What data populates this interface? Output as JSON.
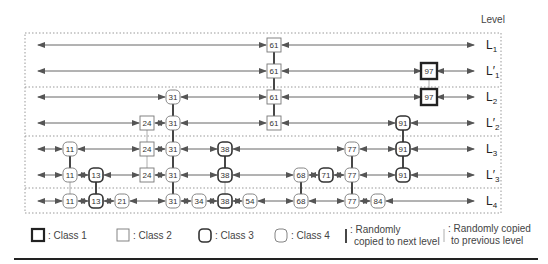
{
  "header": {
    "level_label": "Level"
  },
  "colors": {
    "line": "#555555",
    "node_stroke": "#666666",
    "class1_stroke": "#333333",
    "separator": "#999999",
    "rule": "#222222"
  },
  "levels": [
    {
      "id": "L1",
      "base": "L",
      "prime": "",
      "sub": "1",
      "y": 45
    },
    {
      "id": "L1p",
      "base": "L",
      "prime": "′",
      "sub": "1",
      "y": 71
    },
    {
      "id": "L2",
      "base": "L",
      "prime": "",
      "sub": "2",
      "y": 97
    },
    {
      "id": "L2p",
      "base": "L",
      "prime": "′",
      "sub": "2",
      "y": 123
    },
    {
      "id": "L3",
      "base": "L",
      "prime": "",
      "sub": "3",
      "y": 149
    },
    {
      "id": "L3p",
      "base": "L",
      "prime": "′",
      "sub": "3",
      "y": 175
    },
    {
      "id": "L4",
      "base": "L",
      "prime": "",
      "sub": "4",
      "y": 201
    }
  ],
  "columns": {
    "11": 70,
    "13": 96,
    "21": 122,
    "24": 147,
    "31": 173,
    "34": 199,
    "38": 225,
    "54": 250,
    "61": 274,
    "68": 301,
    "71": 326,
    "77": 352,
    "84": 378,
    "91": 403,
    "97": 429
  },
  "rows": [
    {
      "level": "L1",
      "nodes": [
        {
          "key": "61",
          "cls": 2
        }
      ]
    },
    {
      "level": "L1p",
      "nodes": [
        {
          "key": "61",
          "cls": 2
        },
        {
          "key": "97",
          "cls": 1
        }
      ]
    },
    {
      "level": "L2",
      "nodes": [
        {
          "key": "31",
          "cls": 4
        },
        {
          "key": "61",
          "cls": 2
        },
        {
          "key": "97",
          "cls": 1
        }
      ]
    },
    {
      "level": "L2p",
      "nodes": [
        {
          "key": "24",
          "cls": 2
        },
        {
          "key": "31",
          "cls": 4
        },
        {
          "key": "61",
          "cls": 2
        },
        {
          "key": "91",
          "cls": 3
        }
      ]
    },
    {
      "level": "L3",
      "nodes": [
        {
          "key": "11",
          "cls": 4
        },
        {
          "key": "24",
          "cls": 2
        },
        {
          "key": "31",
          "cls": 4
        },
        {
          "key": "38",
          "cls": 3
        },
        {
          "key": "77",
          "cls": 4
        },
        {
          "key": "91",
          "cls": 3
        }
      ]
    },
    {
      "level": "L3p",
      "nodes": [
        {
          "key": "11",
          "cls": 4
        },
        {
          "key": "13",
          "cls": 3
        },
        {
          "key": "24",
          "cls": 2
        },
        {
          "key": "31",
          "cls": 4
        },
        {
          "key": "38",
          "cls": 3
        },
        {
          "key": "68",
          "cls": 4
        },
        {
          "key": "71",
          "cls": 3
        },
        {
          "key": "77",
          "cls": 4
        },
        {
          "key": "91",
          "cls": 3
        }
      ]
    },
    {
      "level": "L4",
      "nodes": [
        {
          "key": "11",
          "cls": 4
        },
        {
          "key": "13",
          "cls": 3
        },
        {
          "key": "21",
          "cls": 4
        },
        {
          "key": "31",
          "cls": 4
        },
        {
          "key": "34",
          "cls": 4
        },
        {
          "key": "38",
          "cls": 3
        },
        {
          "key": "54",
          "cls": 4
        },
        {
          "key": "68",
          "cls": 4
        },
        {
          "key": "77",
          "cls": 4
        },
        {
          "key": "84",
          "cls": 4
        }
      ]
    }
  ],
  "vertical_links": [
    {
      "key": "61",
      "from": "L1",
      "to": "L1p",
      "type": "next"
    },
    {
      "key": "61",
      "from": "L1p",
      "to": "L2",
      "type": "next"
    },
    {
      "key": "61",
      "from": "L2",
      "to": "L2p",
      "type": "next"
    },
    {
      "key": "97",
      "from": "L1p",
      "to": "L2",
      "type": "prev"
    },
    {
      "key": "31",
      "from": "L2",
      "to": "L2p",
      "type": "next"
    },
    {
      "key": "31",
      "from": "L2p",
      "to": "L3",
      "type": "next"
    },
    {
      "key": "31",
      "from": "L3",
      "to": "L3p",
      "type": "next"
    },
    {
      "key": "31",
      "from": "L3p",
      "to": "L4",
      "type": "next"
    },
    {
      "key": "24",
      "from": "L2p",
      "to": "L3",
      "type": "prev"
    },
    {
      "key": "24",
      "from": "L3",
      "to": "L3p",
      "type": "prev"
    },
    {
      "key": "91",
      "from": "L2p",
      "to": "L3",
      "type": "next"
    },
    {
      "key": "91",
      "from": "L3",
      "to": "L3p",
      "type": "next"
    },
    {
      "key": "11",
      "from": "L3",
      "to": "L3p",
      "type": "next"
    },
    {
      "key": "11",
      "from": "L3p",
      "to": "L4",
      "type": "prev"
    },
    {
      "key": "13",
      "from": "L3p",
      "to": "L4",
      "type": "next"
    },
    {
      "key": "38",
      "from": "L3",
      "to": "L3p",
      "type": "next"
    },
    {
      "key": "38",
      "from": "L3p",
      "to": "L4",
      "type": "prev"
    },
    {
      "key": "77",
      "from": "L3",
      "to": "L3p",
      "type": "next"
    },
    {
      "key": "77",
      "from": "L3p",
      "to": "L4",
      "type": "next"
    },
    {
      "key": "68",
      "from": "L3p",
      "to": "L4",
      "type": "next"
    }
  ],
  "separators_y": [
    87,
    136,
    188
  ],
  "legend": {
    "class1": ": Class 1",
    "class2": ": Class 2",
    "class3": ": Class 3",
    "class4": ": Class 4",
    "next_line1": ": Randomly",
    "next_line2": "copied to next level",
    "prev_line1": ": Randomly copied",
    "prev_line2": "to previous level"
  }
}
